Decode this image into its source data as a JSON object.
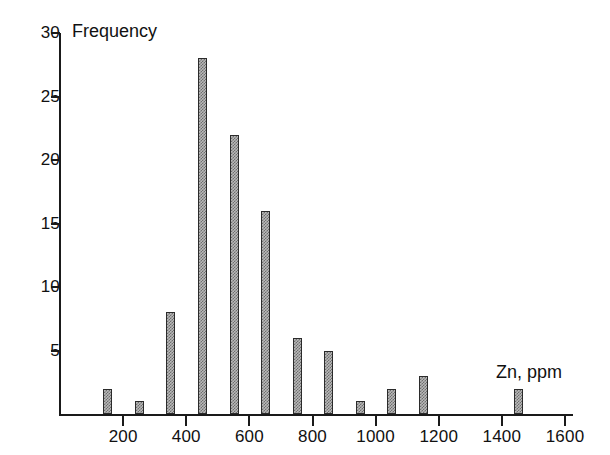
{
  "chart_data": {
    "type": "bar",
    "title": "",
    "xlabel": "Zn, ppm",
    "ylabel": "Frequency",
    "categories": [
      150,
      250,
      350,
      450,
      550,
      650,
      750,
      850,
      950,
      1050,
      1150,
      1450
    ],
    "values": [
      2,
      1,
      8,
      28,
      22,
      16,
      6,
      5,
      1,
      2,
      3,
      2
    ],
    "x_tick_labels": [
      "200",
      "400",
      "600",
      "800",
      "1000",
      "1200",
      "1400",
      "1600"
    ],
    "x_tick_values": [
      200,
      400,
      600,
      800,
      1000,
      1200,
      1400,
      1600
    ],
    "y_tick_labels": [
      "5",
      "10",
      "15",
      "20",
      "25",
      "30"
    ],
    "y_tick_values": [
      5,
      10,
      15,
      20,
      25,
      30
    ],
    "xlim": [
      0,
      1600
    ],
    "ylim": [
      0,
      30
    ],
    "grid": false,
    "legend": false,
    "bar_color": "#b9b9b9",
    "bar_edge_color": "#2b2b2b",
    "axis_color": "#1a1a1a"
  }
}
